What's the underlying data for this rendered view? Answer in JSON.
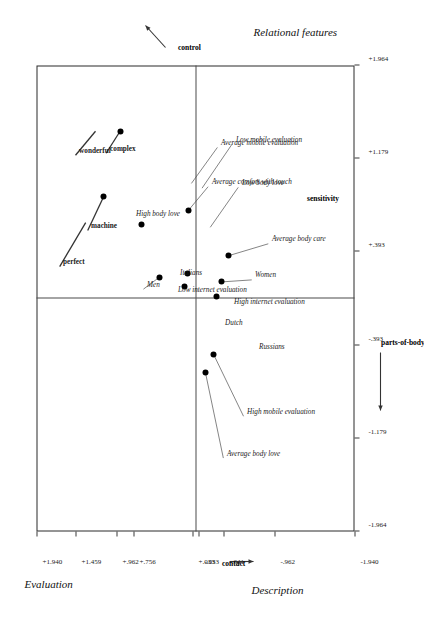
{
  "figure": {
    "type": "correspondence-analysis-biplot",
    "orientation_deg": -90,
    "axes": {
      "horizontal": {
        "title": "Relational features",
        "pole_negative": "contact",
        "pole_positive": "control",
        "ticks": [
          "-1.964",
          "-1.179",
          "-.393",
          "+.393",
          "+1.179",
          "+1.964"
        ]
      },
      "vertical": {
        "title": "Description",
        "pole_positive": "parts-of-body",
        "pole_negative": "sensitivity",
        "title_secondary": "Evaluation",
        "ticks": [
          "+1.940",
          "+1.459",
          "+.962",
          "+.756",
          "+.033",
          "-.033",
          "-.341",
          "-.962",
          "-1.940"
        ]
      }
    }
  },
  "chart_data": {
    "type": "scatter",
    "title": "",
    "xlabel": "Relational features",
    "ylabel": "Description",
    "ylabel_secondary": "Evaluation",
    "xlim": [
      -1.964,
      1.964
    ],
    "ylim": [
      -1.94,
      1.94
    ],
    "grid": false,
    "legend": "none",
    "xticks": [
      -1.964,
      -1.179,
      -0.393,
      0.393,
      1.179,
      1.964
    ],
    "xticklabels": [
      "-1.964",
      "-1.179",
      "-.393",
      "+.393",
      "+1.179",
      "+1.964"
    ],
    "yticks": [
      1.94,
      1.459,
      0.962,
      0.756,
      0.033,
      -0.033,
      -0.341,
      -0.962,
      -1.94
    ],
    "yticklabels": [
      "+1.940",
      "+1.459",
      "+.962",
      "+.756",
      "+.033",
      "-.033",
      "-.341",
      "-.962",
      "-1.940"
    ],
    "quadrant_poles": {
      "x_negative": "contact",
      "x_positive": "control",
      "y_positive": "parts-of-body",
      "y_negative": "sensitivity"
    },
    "points": [
      {
        "label": "perfect",
        "style": "bold",
        "x": 0.64,
        "y": 1.34,
        "has_point": false,
        "leader": true
      },
      {
        "label": "machine",
        "style": "bold",
        "x": 0.86,
        "y": 1.12,
        "has_point": true,
        "leader": true
      },
      {
        "label": "wonderful",
        "style": "bold",
        "x": 1.41,
        "y": 1.22,
        "has_point": false,
        "leader": true
      },
      {
        "label": "complex",
        "style": "bold",
        "x": 1.41,
        "y": 0.92,
        "has_point": true,
        "leader": true
      },
      {
        "label": "High body love",
        "style": "italic",
        "x": 0.62,
        "y": 0.66,
        "has_point": true,
        "leader": false
      },
      {
        "label": "Men",
        "style": "italic",
        "x": 0.18,
        "y": 0.44,
        "has_point": true,
        "leader": true
      },
      {
        "label": "Low internet evaluation",
        "style": "italic",
        "x": 0.1,
        "y": 0.13,
        "has_point": true,
        "leader": false
      },
      {
        "label": "Italians",
        "style": "italic",
        "x": 0.21,
        "y": 0.1,
        "has_point": true,
        "leader": false
      },
      {
        "label": "Average comfort with touch",
        "style": "italic",
        "x": 0.74,
        "y": 0.09,
        "has_point": true,
        "leader": true
      },
      {
        "label": "Average mobile evaluation",
        "style": "italic",
        "x": 0.97,
        "y": 0.05,
        "has_point": false,
        "leader": true
      },
      {
        "label": "Low mobile evaluation",
        "style": "italic",
        "x": 0.93,
        "y": -0.08,
        "has_point": false,
        "leader": true
      },
      {
        "label": "Average body love",
        "style": "italic",
        "x": -0.62,
        "y": -0.12,
        "has_point": true,
        "leader": true
      },
      {
        "label": "High mobile evaluation",
        "style": "italic",
        "x": -0.47,
        "y": -0.22,
        "has_point": true,
        "leader": true
      },
      {
        "label": "Russians",
        "style": "italic",
        "x": -0.28,
        "y": -0.46,
        "has_point": false,
        "leader": false
      },
      {
        "label": "Dutch",
        "style": "italic",
        "x": -0.13,
        "y": -0.17,
        "has_point": false,
        "leader": false
      },
      {
        "label": "High internet evaluation",
        "style": "italic",
        "x": 0.02,
        "y": -0.26,
        "has_point": true,
        "leader": false
      },
      {
        "label": "Women",
        "style": "italic",
        "x": 0.14,
        "y": -0.32,
        "has_point": true,
        "leader": true
      },
      {
        "label": "Average body care",
        "style": "italic",
        "x": 0.36,
        "y": -0.4,
        "has_point": true,
        "leader": true
      },
      {
        "label": "Low body love",
        "style": "italic",
        "x": 0.6,
        "y": -0.18,
        "has_point": false,
        "leader": true
      }
    ]
  },
  "colors": {
    "point": "#000000",
    "frame": "#2b2b2b",
    "axis": "#4a4a4a",
    "text": "#1a1a1a",
    "background": "#ffffff"
  }
}
